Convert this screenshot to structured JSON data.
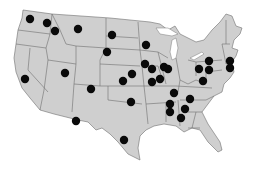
{
  "map": {
    "title": "United States locations map",
    "colors": {
      "land": "#cfcfcf",
      "borders": "#6f6f6f",
      "dots": "#0a0a0a",
      "background": "#ffffff"
    },
    "dot_radius": 4.2,
    "locations": [
      {
        "x": 30,
        "y": 19
      },
      {
        "x": 47,
        "y": 23
      },
      {
        "x": 55,
        "y": 31
      },
      {
        "x": 78,
        "y": 29
      },
      {
        "x": 112,
        "y": 35
      },
      {
        "x": 107,
        "y": 52
      },
      {
        "x": 146,
        "y": 45
      },
      {
        "x": 25,
        "y": 79
      },
      {
        "x": 65,
        "y": 73
      },
      {
        "x": 91,
        "y": 89
      },
      {
        "x": 123,
        "y": 81
      },
      {
        "x": 132,
        "y": 74
      },
      {
        "x": 131,
        "y": 102
      },
      {
        "x": 145,
        "y": 64
      },
      {
        "x": 152,
        "y": 69
      },
      {
        "x": 168,
        "y": 69
      },
      {
        "x": 152,
        "y": 82
      },
      {
        "x": 160,
        "y": 79
      },
      {
        "x": 164,
        "y": 67
      },
      {
        "x": 174,
        "y": 93
      },
      {
        "x": 170,
        "y": 104
      },
      {
        "x": 170,
        "y": 112
      },
      {
        "x": 190,
        "y": 99
      },
      {
        "x": 185,
        "y": 109
      },
      {
        "x": 181,
        "y": 118
      },
      {
        "x": 199,
        "y": 69
      },
      {
        "x": 209,
        "y": 61
      },
      {
        "x": 209,
        "y": 70
      },
      {
        "x": 203,
        "y": 81
      },
      {
        "x": 230,
        "y": 61
      },
      {
        "x": 230,
        "y": 68
      },
      {
        "x": 76,
        "y": 121
      },
      {
        "x": 124,
        "y": 140
      }
    ]
  }
}
